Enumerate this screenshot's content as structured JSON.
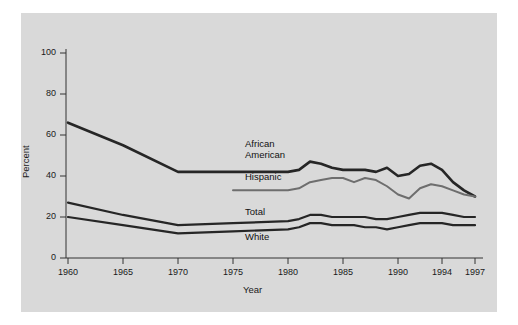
{
  "chart_data": {
    "type": "line",
    "title": "",
    "xlabel": "Year",
    "ylabel": "Percent",
    "xlim": [
      1960,
      1997
    ],
    "ylim": [
      0,
      100
    ],
    "xticks": [
      1960,
      1965,
      1970,
      1975,
      1980,
      1985,
      1990,
      1994,
      1997
    ],
    "xtick_labels": [
      "1960",
      "1965",
      "1970",
      "1975",
      "1980",
      "1985",
      "1990",
      "1994",
      "1997"
    ],
    "yticks": [
      0,
      20,
      40,
      60,
      80,
      100
    ],
    "ytick_labels": [
      "0",
      "20",
      "40",
      "60",
      "80",
      "100"
    ],
    "grid": false,
    "legend_position": "inline-labels",
    "series": [
      {
        "name": "African American",
        "label_lines": [
          "African",
          "American"
        ],
        "color": "#262626",
        "width": 2.6,
        "x": [
          1960,
          1965,
          1970,
          1975,
          1980,
          1981,
          1982,
          1983,
          1984,
          1985,
          1986,
          1987,
          1988,
          1989,
          1990,
          1991,
          1992,
          1993,
          1994,
          1995,
          1996,
          1997
        ],
        "y": [
          66,
          55,
          42,
          42,
          42,
          43,
          47,
          46,
          44,
          43,
          43,
          43,
          42,
          44,
          40,
          41,
          45,
          46,
          43,
          37,
          33,
          30
        ]
      },
      {
        "name": "Hispanic",
        "label_lines": [
          "Hispanic"
        ],
        "color": "#6e6e6e",
        "width": 2.0,
        "x": [
          1975,
          1980,
          1981,
          1982,
          1983,
          1984,
          1985,
          1986,
          1987,
          1988,
          1989,
          1990,
          1991,
          1992,
          1993,
          1994,
          1995,
          1996,
          1997
        ],
        "y": [
          33,
          33,
          34,
          37,
          38,
          39,
          39,
          37,
          39,
          38,
          35,
          31,
          29,
          34,
          36,
          35,
          33,
          31,
          30
        ]
      },
      {
        "name": "Total",
        "label_lines": [
          "Total"
        ],
        "color": "#262626",
        "width": 2.2,
        "x": [
          1960,
          1965,
          1970,
          1975,
          1980,
          1981,
          1982,
          1983,
          1984,
          1985,
          1986,
          1987,
          1988,
          1989,
          1990,
          1991,
          1992,
          1993,
          1994,
          1995,
          1996,
          1997
        ],
        "y": [
          27,
          21,
          16,
          17,
          18,
          19,
          21,
          21,
          20,
          20,
          20,
          20,
          19,
          19,
          20,
          21,
          22,
          22,
          22,
          21,
          20,
          20
        ]
      },
      {
        "name": "White",
        "label_lines": [
          "White"
        ],
        "color": "#262626",
        "width": 2.2,
        "x": [
          1960,
          1965,
          1970,
          1975,
          1980,
          1981,
          1982,
          1983,
          1984,
          1985,
          1986,
          1987,
          1988,
          1989,
          1990,
          1991,
          1992,
          1993,
          1994,
          1995,
          1996,
          1997
        ],
        "y": [
          20,
          16,
          12,
          13,
          14,
          15,
          17,
          17,
          16,
          16,
          16,
          15,
          15,
          14,
          15,
          16,
          17,
          17,
          17,
          16,
          16,
          16
        ]
      }
    ],
    "inline_labels": [
      {
        "text": "African",
        "series": "African American"
      },
      {
        "text": "American",
        "series": "African American"
      },
      {
        "text": "Hispanic",
        "series": "Hispanic"
      },
      {
        "text": "Total",
        "series": "Total"
      },
      {
        "text": "White",
        "series": "White"
      }
    ]
  }
}
